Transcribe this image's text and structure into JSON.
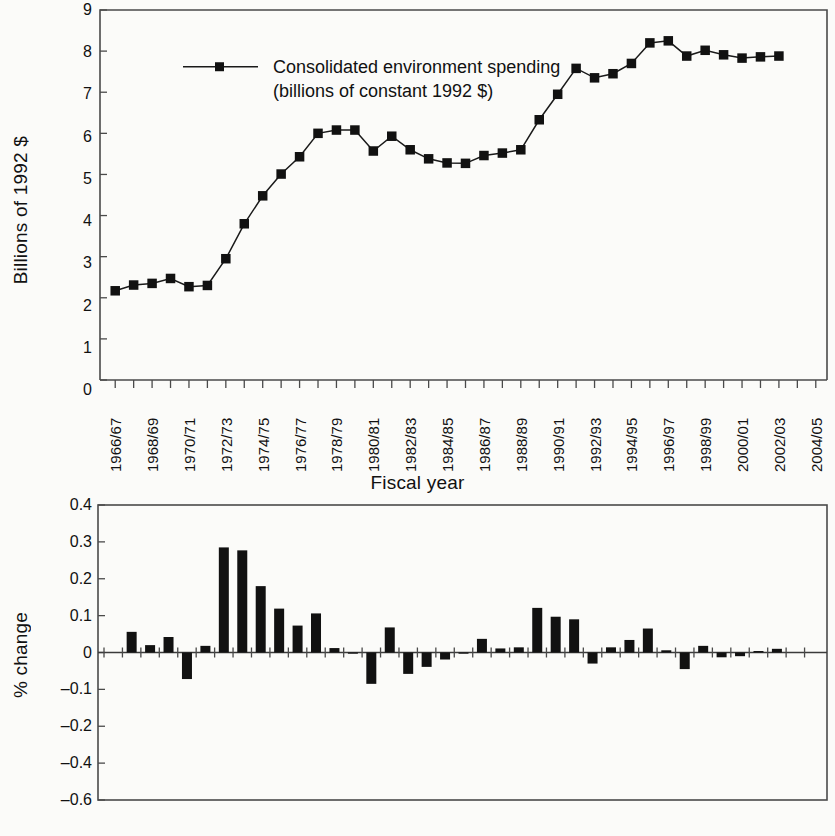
{
  "chart_data": [
    {
      "id": "top",
      "type": "line",
      "title": "",
      "xlabel": "Fiscal year",
      "ylabel": "Billions of 1992 $",
      "ylim": [
        0,
        9
      ],
      "yticks": [
        0,
        1,
        2,
        3,
        4,
        5,
        6,
        7,
        8,
        9
      ],
      "ytick_labels": [
        "0",
        "1",
        "2",
        "3",
        "4",
        "5",
        "6",
        "7",
        "8",
        "9"
      ],
      "grid": false,
      "legend_position": "upper-left-inside",
      "legend": [
        "Consolidated environment spending",
        "(billions of constant 1992 $)"
      ],
      "legend_line1": "Consolidated environment spending",
      "legend_line2": "(billions of constant 1992 $)",
      "categories": [
        "1966/67",
        "1967/68",
        "1968/69",
        "1969/70",
        "1970/71",
        "1971/72",
        "1972/73",
        "1973/74",
        "1974/75",
        "1975/76",
        "1976/77",
        "1977/78",
        "1978/79",
        "1979/80",
        "1980/81",
        "1981/82",
        "1982/83",
        "1983/84",
        "1984/85",
        "1985/86",
        "1986/87",
        "1987/88",
        "1988/89",
        "1989/90",
        "1990/91",
        "1991/92",
        "1992/93",
        "1993/94",
        "1994/95",
        "1995/96",
        "1996/97",
        "1997/98",
        "1998/99",
        "1999/00",
        "2000/01",
        "2001/02",
        "2002/03",
        "2003/04",
        "2004/05"
      ],
      "xtick_labels": [
        "1966/67",
        "1968/69",
        "1970/71",
        "1972/73",
        "1974/75",
        "1976/77",
        "1978/79",
        "1980/81",
        "1982/83",
        "1984/85",
        "1986/87",
        "1988/89",
        "1990/91",
        "1992/93",
        "1994/95",
        "1996/97",
        "1998/99",
        "2000/01",
        "2002/03",
        "2004/05"
      ],
      "series": [
        {
          "name": "Consolidated environment spending (billions of constant 1992 $)",
          "values": [
            2.17,
            2.31,
            2.35,
            2.47,
            2.27,
            2.3,
            2.95,
            3.8,
            4.48,
            5.01,
            5.43,
            6.0,
            6.08,
            6.08,
            5.57,
            5.93,
            5.6,
            5.38,
            5.28,
            5.27,
            5.46,
            5.52,
            5.6,
            6.33,
            6.95,
            7.58,
            7.35,
            7.45,
            7.7,
            8.2,
            8.25,
            7.88,
            8.02,
            7.91,
            7.83,
            7.86,
            7.88,
            null,
            null
          ]
        }
      ]
    },
    {
      "id": "bottom",
      "type": "bar",
      "title": "",
      "xlabel": "",
      "ylabel": "% change",
      "ylim": [
        -0.6,
        0.4
      ],
      "yticks": [
        0.4,
        0.3,
        0.2,
        0.1,
        0,
        -0.1,
        -0.2,
        -0.4,
        -0.6
      ],
      "ytick_labels": [
        "0.4",
        "0.3",
        "0.2",
        "0.1",
        "0",
        "–0.1",
        "–0.2",
        "–0.4",
        "–0.6"
      ],
      "grid": false,
      "categories": [
        "1966/67",
        "1967/68",
        "1968/69",
        "1969/70",
        "1970/71",
        "1971/72",
        "1972/73",
        "1973/74",
        "1974/75",
        "1975/76",
        "1976/77",
        "1977/78",
        "1978/79",
        "1979/80",
        "1980/81",
        "1981/82",
        "1982/83",
        "1983/84",
        "1984/85",
        "1985/86",
        "1986/87",
        "1987/88",
        "1988/89",
        "1989/90",
        "1990/91",
        "1991/92",
        "1992/93",
        "1993/94",
        "1994/95",
        "1995/96",
        "1996/97",
        "1997/98",
        "1998/99",
        "1999/00",
        "2000/01",
        "2001/02",
        "2002/03",
        "2003/04",
        "2004/05"
      ],
      "values": [
        null,
        0.056,
        0.02,
        0.042,
        -0.072,
        0.018,
        0.285,
        0.277,
        0.18,
        0.119,
        0.073,
        0.106,
        0.012,
        -0.002,
        -0.085,
        0.068,
        -0.058,
        -0.039,
        -0.019,
        -0.003,
        0.037,
        0.011,
        0.014,
        0.121,
        0.097,
        0.09,
        -0.03,
        0.014,
        0.034,
        0.065,
        0.006,
        -0.045,
        0.018,
        -0.013,
        -0.01,
        0.004,
        0.01,
        null,
        null
      ]
    }
  ],
  "top_chart": {
    "ylabel": "Billions of 1992 $",
    "xlabel": "Fiscal year",
    "legend_line1": "Consolidated environment spending",
    "legend_line2": "(billions of constant 1992 $)"
  },
  "bottom_chart": {
    "ylabel": "% change"
  },
  "colors": {
    "ink": "#111111",
    "axis": "#4a4a4a",
    "background": "#fbfbf9"
  }
}
